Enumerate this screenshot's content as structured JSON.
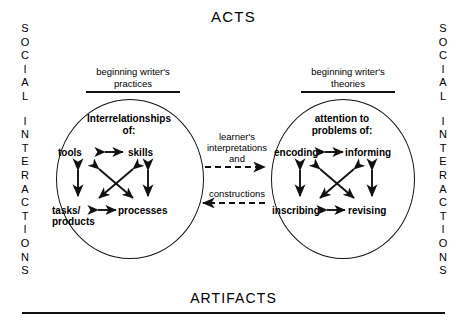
{
  "diagram": {
    "top_label": "ACTS",
    "bottom_label": "ARTIFACTS",
    "side_left": {
      "word1": "SOCIAL",
      "word2": "INTERACTIONS"
    },
    "side_right": {
      "word1": "SOCIAL",
      "word2": "INTERACTIONS"
    },
    "left_group": {
      "heading_line1": "beginning writer's",
      "heading_line2": "practices",
      "title_line1": "Interrelationships",
      "title_line2": "of:",
      "nodes": {
        "top_left": "tools",
        "top_right": "skills",
        "bottom_left_line1": "tasks/",
        "bottom_left_line2": "products",
        "bottom_right": "processes"
      }
    },
    "right_group": {
      "heading_line1": "beginning writer's",
      "heading_line2": "theories",
      "title_line1": "attention to",
      "title_line2": "problems of:",
      "nodes": {
        "top_left": "encoding",
        "top_right": "informing",
        "bottom_left": "inscribing",
        "bottom_right": "revising"
      }
    },
    "center": {
      "forward_line1": "learner's",
      "forward_line2": "interpretations",
      "forward_line3": "and",
      "backward_line1": "constructions"
    },
    "colors": {
      "ink": "#111111",
      "background": "#ffffff"
    }
  }
}
